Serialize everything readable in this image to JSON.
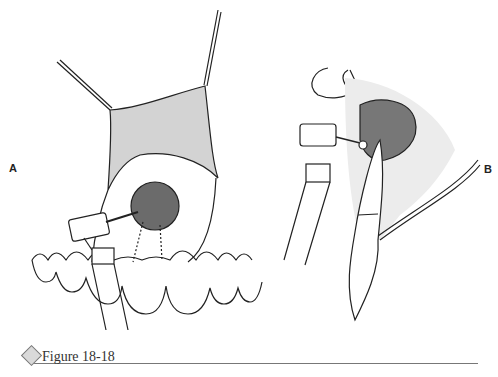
{
  "figure": {
    "panels": [
      {
        "label": "A",
        "description": "Frontal view: retracted mucoperiosteal flap exposing lesion above anterior maxillary teeth, handpiece with bur reaching lesion"
      },
      {
        "label": "B",
        "description": "Sagittal section: lesion in bone at tooth apex, handpiece with round bur"
      }
    ],
    "colors": {
      "flap_fill": "#d3d3d3",
      "lesion_fill": "#6e6e6e",
      "line": "#222222"
    }
  },
  "caption": {
    "text": "Figure 18-18",
    "icon": "diamond-icon"
  }
}
